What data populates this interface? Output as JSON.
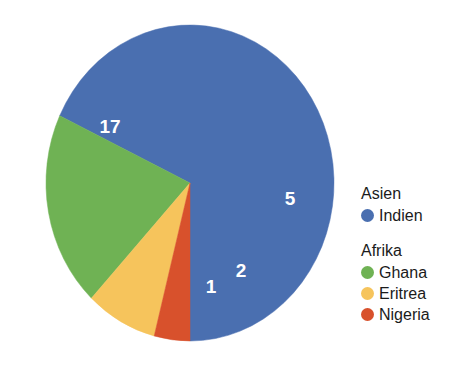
{
  "chart_data": {
    "type": "pie",
    "title": "",
    "subtitle": "",
    "xlabel": "",
    "ylabel": "",
    "total": 25,
    "start_angle_deg": 90,
    "direction": "counterclockwise",
    "grid": false,
    "legend_position": "right",
    "categories": [
      "Indien",
      "Ghana",
      "Eritrea",
      "Nigeria"
    ],
    "values": [
      17,
      5,
      2,
      1
    ],
    "labels": [
      "17",
      "5",
      "2",
      "1"
    ],
    "colors": [
      "#4a6fb0",
      "#6fb254",
      "#f6c45c",
      "#d8512c"
    ],
    "groups": [
      {
        "heading": "Asien",
        "items": [
          {
            "label": "Indien",
            "value": 17,
            "color": "#4a6fb0"
          }
        ]
      },
      {
        "heading": "Afrika",
        "items": [
          {
            "label": "Ghana",
            "value": 5,
            "color": "#6fb254"
          },
          {
            "label": "Eritrea",
            "value": 2,
            "color": "#f6c45c"
          },
          {
            "label": "Nigeria",
            "value": 1,
            "color": "#d8512c"
          }
        ]
      }
    ]
  },
  "pie": {
    "center_x": 190,
    "center_y": 183,
    "radius_x": 144,
    "radius_y": 158,
    "slices": [
      {
        "name": "Indien",
        "value": 17,
        "label": "17",
        "color": "#4a6fb0",
        "label_x": 110,
        "label_y": 128
      },
      {
        "name": "Ghana",
        "value": 5,
        "label": "5",
        "color": "#6fb254",
        "label_x": 290,
        "label_y": 200
      },
      {
        "name": "Eritrea",
        "value": 2,
        "label": "2",
        "color": "#f6c45c",
        "label_x": 241,
        "label_y": 272
      },
      {
        "name": "Nigeria",
        "value": 1,
        "label": "1",
        "color": "#d8512c",
        "label_x": 211,
        "label_y": 288
      }
    ]
  },
  "legend": {
    "asien_heading": "Asien",
    "indien_label": "Indien",
    "afrika_heading": "Afrika",
    "ghana_label": "Ghana",
    "eritrea_label": "Eritrea",
    "nigeria_label": "Nigeria"
  }
}
